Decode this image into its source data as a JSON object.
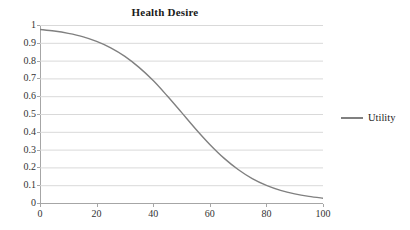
{
  "chart_data": {
    "type": "line",
    "title": "Health Desire",
    "xlabel": "",
    "ylabel": "",
    "xlim": [
      0,
      100
    ],
    "ylim": [
      0,
      1
    ],
    "grid": true,
    "grid_axis": "y",
    "legend_position": "right",
    "line_color": "#808080",
    "grid_color": "#d9d9d9",
    "axis_color": "#a6a6a6",
    "background": "#ffffff",
    "x_ticks": [
      0,
      20,
      40,
      60,
      80,
      100
    ],
    "x_tick_labels": [
      "0",
      "20",
      "40",
      "60",
      "80",
      "100"
    ],
    "y_ticks": [
      0,
      0.1,
      0.2,
      0.3,
      0.4,
      0.5,
      0.6,
      0.7,
      0.8,
      0.9,
      1
    ],
    "y_tick_labels": [
      "0",
      "0.1",
      "0.2",
      "0.3",
      "0.4",
      "0.5",
      "0.6",
      "0.7",
      "0.8",
      "0.9",
      "1"
    ],
    "series": [
      {
        "name": "Utility",
        "color": "#808080",
        "x": [
          0,
          5,
          10,
          15,
          20,
          25,
          30,
          35,
          40,
          45,
          50,
          55,
          60,
          65,
          70,
          75,
          80,
          85,
          90,
          95,
          100
        ],
        "values": [
          0.975,
          0.966,
          0.953,
          0.935,
          0.908,
          0.872,
          0.824,
          0.762,
          0.688,
          0.601,
          0.509,
          0.416,
          0.329,
          0.252,
          0.188,
          0.137,
          0.099,
          0.071,
          0.051,
          0.037,
          0.027
        ]
      }
    ]
  },
  "legend": {
    "entries": [
      {
        "label": "Utility"
      }
    ]
  }
}
